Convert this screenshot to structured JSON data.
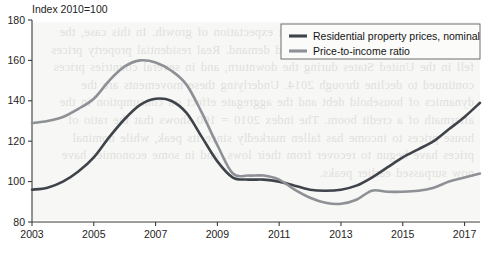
{
  "chart_data": {
    "type": "line",
    "title": "Index 2010=100",
    "xlabel": "",
    "ylabel": "",
    "xlim": [
      2003,
      2017.5
    ],
    "ylim": [
      80,
      180
    ],
    "yticks": [
      80,
      100,
      120,
      140,
      160,
      180
    ],
    "xticks": [
      2003,
      2005,
      2007,
      2009,
      2011,
      2013,
      2015,
      2017
    ],
    "grid": false,
    "legend_position": "top-right",
    "colors": {
      "nominal": "#3f444b",
      "ratio": "#8d9095",
      "axis": "#3c3c3c",
      "plot_background": "#f7f7f5",
      "legend_background": "#fbfbfa",
      "legend_border": "#6e6e6e"
    },
    "x": [
      2003,
      2003.5,
      2004,
      2004.5,
      2005,
      2005.5,
      2006,
      2006.5,
      2007,
      2007.5,
      2008,
      2008.5,
      2009,
      2009.5,
      2010,
      2010.5,
      2011,
      2011.5,
      2012,
      2012.5,
      2013,
      2013.5,
      2014,
      2014.5,
      2015,
      2015.5,
      2016,
      2016.5,
      2017,
      2017.5
    ],
    "series": [
      {
        "name": "Residential property prices, nominal",
        "color": "#3f444b",
        "values": [
          96,
          97,
          100,
          105,
          112,
          122,
          131,
          138,
          141,
          140,
          134,
          122,
          110,
          102,
          101,
          101,
          100,
          98,
          96,
          95.5,
          96,
          98,
          102,
          107,
          112,
          116,
          120,
          126,
          132,
          139
        ]
      },
      {
        "name": "Price-to-income ratio",
        "color": "#8d9095",
        "values": [
          129,
          130,
          132,
          136,
          141,
          150,
          157,
          160,
          159,
          155,
          148,
          134,
          118,
          104,
          103,
          103,
          101,
          96,
          92,
          89.5,
          89,
          91,
          95.5,
          95,
          95,
          95.5,
          97,
          100,
          102,
          104
        ]
      }
    ],
    "legend": [
      {
        "label": "Residential property prices, nominal",
        "color": "#3f444b"
      },
      {
        "label": "Price-to-income ratio",
        "color": "#8d9095"
      }
    ]
  },
  "background_text": "ne explained by a sustained, correct expectation of growth. In this case, the effects of a housing boom depressed demand. Real residential property prices fell in the United States during the downturn, and in several countries prices continued to decline through 2014. Underlying these movements are the dynamics of household debt and the aggregate effect on consumption in the aftermath of a credit boom. The index 2010 = 100 shows that the ratio of house prices to income has fallen markedly since its peak, while nominal prices have begun to recover from their lows, and in some economies have now surpassed earlier peaks."
}
